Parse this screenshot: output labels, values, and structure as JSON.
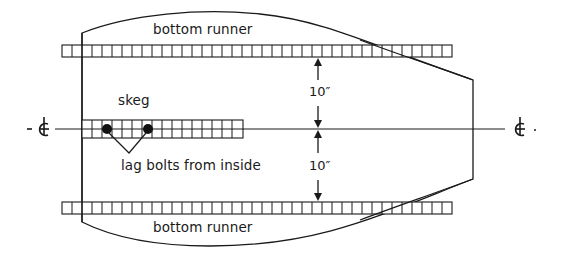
{
  "diagram": {
    "labels": {
      "top_runner": "bottom runner",
      "bottom_runner": "bottom runner",
      "skeg": "skeg",
      "lag_bolts": "lag bolts from inside",
      "dim_upper": "10″",
      "dim_lower": "10″",
      "centerline_left": "- ȼ",
      "centerline_right": "ȼ -"
    },
    "colors": {
      "stroke": "#1a1a1a",
      "background": "#ffffff"
    }
  }
}
